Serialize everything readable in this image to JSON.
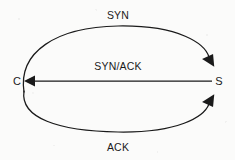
{
  "diagram": {
    "type": "sequence-ellipse",
    "stroke_color": "#1a1a1a",
    "background_color": "#fbfbfa",
    "nodes": [
      {
        "id": "client",
        "label": "C",
        "x": 17,
        "y": 81,
        "name": "node-client"
      },
      {
        "id": "server",
        "label": "S",
        "x": 219,
        "y": 81,
        "name": "node-server"
      }
    ],
    "flows": [
      {
        "id": "syn",
        "label": "SYN",
        "from": "C",
        "to": "S",
        "shape": "arc-top",
        "arrow_at": "S",
        "label_x": 118,
        "label_y": 15
      },
      {
        "id": "syn-ack",
        "label": "SYN/ACK",
        "from": "S",
        "to": "C",
        "shape": "straight",
        "arrow_at": "C",
        "label_x": 118,
        "label_y": 66
      },
      {
        "id": "ack",
        "label": "ACK",
        "from": "C",
        "to": "S",
        "shape": "arc-bottom",
        "arrow_at": "S",
        "label_x": 118,
        "label_y": 147
      }
    ],
    "ellipse": {
      "center_x": 118,
      "center_y": 81,
      "radius_x": 100,
      "radius_y": 53
    }
  }
}
